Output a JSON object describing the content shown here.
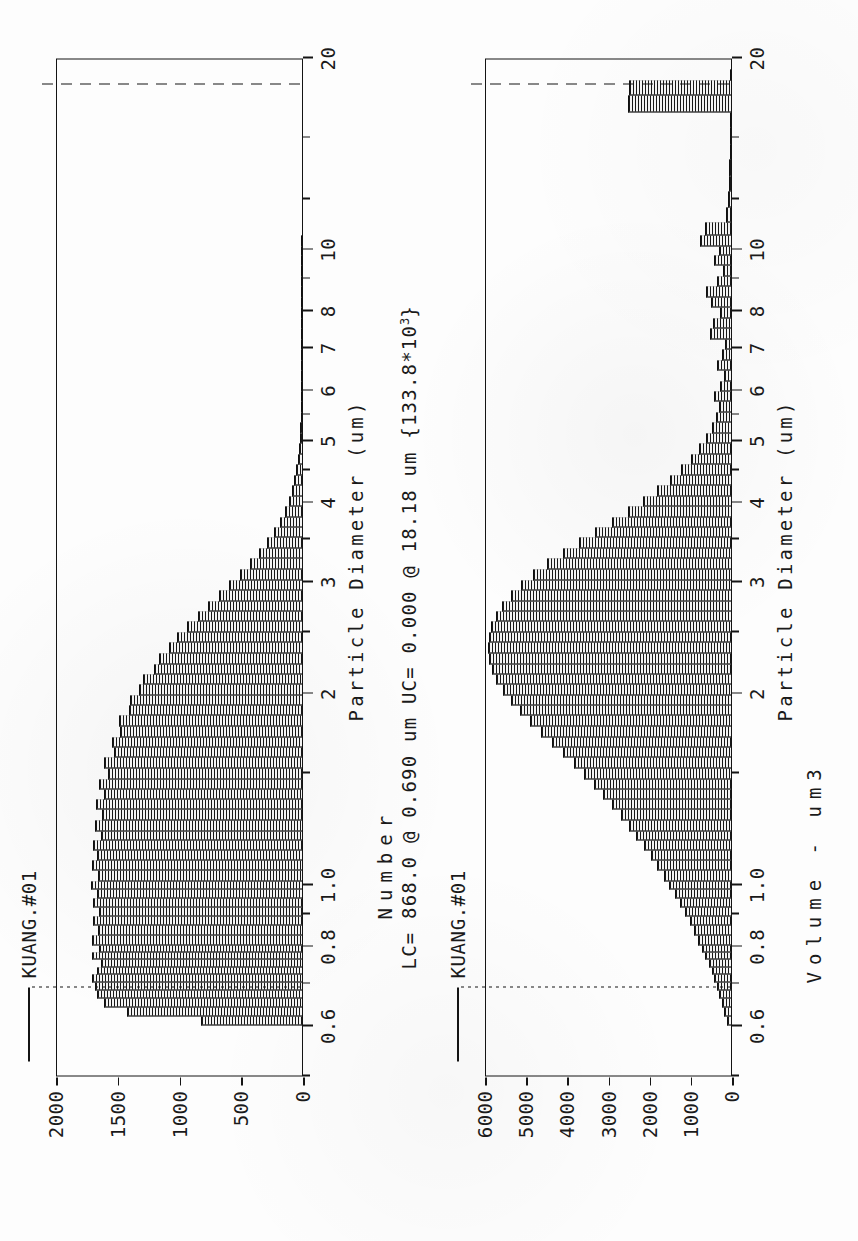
{
  "document": {
    "kind": "particle-size-distribution-report",
    "orientation": "rotated-90-ccw"
  },
  "stats_line": {
    "text": "LC= 868.0 @ 0.690 um UC= 0.000 @ 18.18 um  {133.8*10",
    "exponent": "3",
    "tail": "}",
    "lc_count": "868.0",
    "lc_diameter": "0.690 um",
    "uc_count": "0.000",
    "uc_diameter": "18.18 um",
    "total": "133.8*10^3"
  },
  "chart_data": [
    {
      "type": "bar",
      "id": "number-distribution",
      "title": "",
      "legend": [
        "KUANG.#01"
      ],
      "legend_position": "top-left",
      "xlabel": "Particle Diameter (um)",
      "ylabel": "Number",
      "xscale": "log",
      "xlim": [
        0.5,
        20
      ],
      "ylim": [
        0,
        2000
      ],
      "xticks": [
        0.6,
        0.8,
        1.0,
        2,
        3,
        4,
        5,
        6,
        7,
        8,
        10,
        20
      ],
      "xticklabels": [
        "0.6",
        "0.8",
        "1.0",
        "2",
        "3",
        "4",
        "5",
        "6",
        "7",
        "8",
        "10",
        "20"
      ],
      "yticks": [
        0,
        500,
        1000,
        1500,
        2000
      ],
      "yticklabels": [
        "0",
        "500",
        "1000",
        "1500",
        "2000"
      ],
      "grid": false,
      "markers": [
        {
          "name": "LC",
          "x": 0.69,
          "style": "dotted"
        },
        {
          "name": "UC",
          "x": 18.18,
          "style": "dashed"
        }
      ],
      "x": [
        0.6,
        0.62,
        0.64,
        0.66,
        0.68,
        0.7,
        0.72,
        0.74,
        0.76,
        0.78,
        0.8,
        0.83,
        0.86,
        0.89,
        0.92,
        0.95,
        0.98,
        1.01,
        1.05,
        1.09,
        1.13,
        1.17,
        1.21,
        1.26,
        1.31,
        1.36,
        1.41,
        1.46,
        1.52,
        1.58,
        1.64,
        1.7,
        1.77,
        1.84,
        1.91,
        1.98,
        2.06,
        2.14,
        2.22,
        2.31,
        2.4,
        2.49,
        2.59,
        2.69,
        2.79,
        2.9,
        3.01,
        3.13,
        3.25,
        3.38,
        3.51,
        3.64,
        3.78,
        3.93,
        4.08,
        4.24,
        4.4,
        4.57,
        4.75,
        4.93,
        5.12,
        5.32,
        5.53,
        5.74,
        5.96,
        6.19,
        6.43,
        6.68,
        6.94,
        7.21,
        7.49,
        7.78,
        8.08,
        8.39,
        8.72,
        9.05,
        9.4,
        9.77,
        10.1,
        10.5,
        11.0,
        11.6,
        12.3,
        13.0,
        13.8,
        14.6,
        15.5,
        16.4,
        17.4,
        18.4
      ],
      "values": [
        820,
        1420,
        1600,
        1660,
        1680,
        1700,
        1660,
        1630,
        1700,
        1640,
        1700,
        1650,
        1690,
        1640,
        1690,
        1660,
        1710,
        1650,
        1700,
        1660,
        1690,
        1630,
        1680,
        1620,
        1670,
        1600,
        1640,
        1570,
        1600,
        1520,
        1540,
        1470,
        1480,
        1400,
        1390,
        1320,
        1290,
        1200,
        1160,
        1080,
        1010,
        930,
        840,
        760,
        670,
        590,
        500,
        420,
        350,
        285,
        230,
        180,
        140,
        108,
        82,
        62,
        46,
        34,
        25,
        19,
        14,
        11,
        8,
        6,
        5,
        4,
        3,
        3,
        2,
        2,
        2,
        1,
        1,
        1,
        1,
        1,
        1,
        1,
        1,
        0,
        0,
        0,
        0,
        0,
        0,
        0,
        0,
        0,
        0,
        0
      ],
      "peak_value": 1710,
      "peak_x": 0.98
    },
    {
      "type": "bar",
      "id": "volume-distribution",
      "title": "",
      "legend": [
        "KUANG.#01"
      ],
      "legend_position": "top-left",
      "xlabel": "Particle Diameter (um)",
      "ylabel": "Volume - um3",
      "xscale": "log",
      "xlim": [
        0.5,
        20
      ],
      "ylim": [
        0,
        6000
      ],
      "xticks": [
        0.6,
        0.8,
        1.0,
        2,
        3,
        4,
        5,
        6,
        7,
        8,
        10,
        20
      ],
      "xticklabels": [
        "0.6",
        "0.8",
        "1.0",
        "2",
        "3",
        "4",
        "5",
        "6",
        "7",
        "8",
        "10",
        "20"
      ],
      "yticks": [
        0,
        1000,
        2000,
        3000,
        4000,
        5000,
        6000
      ],
      "yticklabels": [
        "0",
        "1000",
        "2000",
        "3000",
        "4000",
        "5000",
        "6000"
      ],
      "grid": false,
      "markers": [
        {
          "name": "LC",
          "x": 0.69,
          "style": "dotted"
        },
        {
          "name": "UC",
          "x": 18.18,
          "style": "dashed"
        }
      ],
      "x": [
        0.6,
        0.62,
        0.64,
        0.66,
        0.68,
        0.7,
        0.72,
        0.74,
        0.76,
        0.78,
        0.8,
        0.83,
        0.86,
        0.89,
        0.92,
        0.95,
        0.98,
        1.01,
        1.05,
        1.09,
        1.13,
        1.17,
        1.21,
        1.26,
        1.31,
        1.36,
        1.41,
        1.46,
        1.52,
        1.58,
        1.64,
        1.7,
        1.77,
        1.84,
        1.91,
        1.98,
        2.06,
        2.14,
        2.22,
        2.31,
        2.4,
        2.49,
        2.59,
        2.69,
        2.79,
        2.9,
        3.01,
        3.13,
        3.25,
        3.38,
        3.51,
        3.64,
        3.78,
        3.93,
        4.08,
        4.24,
        4.4,
        4.57,
        4.75,
        4.93,
        5.12,
        5.32,
        5.53,
        5.74,
        5.96,
        6.19,
        6.43,
        6.68,
        6.94,
        7.21,
        7.49,
        7.78,
        8.08,
        8.39,
        8.72,
        9.05,
        9.4,
        9.77,
        10.1,
        10.5,
        11.0,
        11.6,
        12.3,
        13.0,
        13.8,
        14.6,
        15.5,
        16.4,
        17.4,
        18.4
      ],
      "values": [
        90,
        160,
        220,
        280,
        340,
        410,
        470,
        540,
        620,
        700,
        790,
        890,
        1000,
        1110,
        1230,
        1360,
        1500,
        1640,
        1790,
        1950,
        2120,
        2300,
        2480,
        2670,
        2880,
        3100,
        3330,
        3570,
        3820,
        4080,
        4350,
        4620,
        4880,
        5130,
        5350,
        5540,
        5700,
        5810,
        5880,
        5910,
        5890,
        5830,
        5720,
        5560,
        5350,
        5100,
        4800,
        4460,
        4090,
        3700,
        3300,
        2900,
        2510,
        2140,
        1800,
        1490,
        1220,
        980,
        780,
        610,
        470,
        360,
        300,
        420,
        260,
        180,
        330,
        210,
        150,
        520,
        430,
        260,
        480,
        600,
        340,
        200,
        420,
        280,
        760,
        640,
        120,
        80,
        60,
        40,
        30,
        20,
        15,
        2500,
        2480,
        10
      ],
      "peak_value": 5910,
      "peak_x": 2.31,
      "annotations": [
        {
          "label": "outlier-bar",
          "x_range": [
            16.4,
            17.4
          ],
          "value": 2500
        }
      ]
    }
  ]
}
